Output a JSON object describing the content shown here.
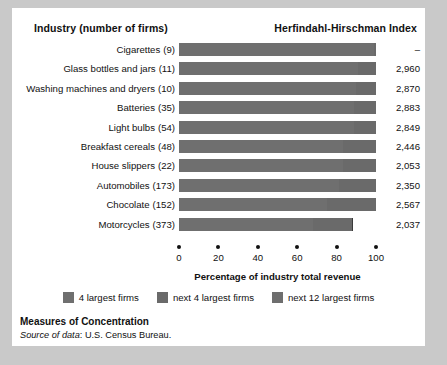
{
  "header": {
    "industry_col": "Industry (number of firms)",
    "hhi_col": "Herfindahl-Hirschman Index"
  },
  "caption": {
    "title": "Measures of Concentration",
    "source_label": "Source of data",
    "source_value": "U.S. Census Bureau."
  },
  "axis": {
    "title": "Percentage of industry total revenue",
    "ticks": [
      "0",
      "20",
      "40",
      "60",
      "80",
      "100"
    ]
  },
  "legend": [
    {
      "label": "4 largest firms",
      "color": "#6f6f6f"
    },
    {
      "label": "next 4 largest firms",
      "color": "#6a6a6a"
    },
    {
      "label": "next 12 largest firms",
      "color": "#6e6e6e"
    }
  ],
  "chart_data": {
    "type": "bar",
    "title": "Measures of Concentration",
    "xlabel": "Percentage of industry total revenue",
    "ylabel": "Industry (number of firms)",
    "xlim": [
      0,
      100
    ],
    "grid": false,
    "legend_position": "bottom",
    "orientation": "horizontal",
    "stacked": true,
    "categories": [
      "Cigarettes",
      "Glass bottles and jars",
      "Washing machines and dryers",
      "Batteries",
      "Light bulbs",
      "Breakfast cereals",
      "House slippers",
      "Automobiles",
      "Chocolate",
      "Motorcycles"
    ],
    "firms": [
      9,
      11,
      10,
      35,
      54,
      48,
      22,
      173,
      152,
      373
    ],
    "hhi": [
      "–",
      "2,960",
      "2,870",
      "2,883",
      "2,849",
      "2,446",
      "2,053",
      "2,350",
      "2,567",
      "2,037"
    ],
    "series": [
      {
        "name": "4 largest firms",
        "values": [
          99,
          91,
          90,
          89,
          89,
          83,
          83,
          81,
          75,
          68
        ]
      },
      {
        "name": "next 4 largest firms",
        "values": [
          1,
          9,
          10,
          11,
          11,
          17,
          17,
          19,
          25,
          20
        ]
      },
      {
        "name": "next 12 largest firms",
        "values": [
          0,
          0,
          0,
          0,
          0,
          0,
          0,
          0,
          0,
          0
        ]
      }
    ],
    "rows": [
      {
        "label": "Cigarettes",
        "firms": "(9)",
        "hhi": "–",
        "s1": 99,
        "s2": 1,
        "s3": 0
      },
      {
        "label": "Glass bottles and jars",
        "firms": "(11)",
        "hhi": "2,960",
        "s1": 91,
        "s2": 9,
        "s3": 0
      },
      {
        "label": "Washing machines and dryers",
        "firms": "(10)",
        "hhi": "2,870",
        "s1": 90,
        "s2": 10,
        "s3": 0
      },
      {
        "label": "Batteries",
        "firms": "(35)",
        "hhi": "2,883",
        "s1": 89,
        "s2": 11,
        "s3": 0
      },
      {
        "label": "Light bulbs",
        "firms": "(54)",
        "hhi": "2,849",
        "s1": 89,
        "s2": 11,
        "s3": 0
      },
      {
        "label": "Breakfast cereals",
        "firms": "(48)",
        "hhi": "2,446",
        "s1": 83,
        "s2": 17,
        "s3": 0
      },
      {
        "label": "House slippers",
        "firms": "(22)",
        "hhi": "2,053",
        "s1": 83,
        "s2": 17,
        "s3": 0
      },
      {
        "label": "Automobiles",
        "firms": "(173)",
        "hhi": "2,350",
        "s1": 81,
        "s2": 19,
        "s3": 0
      },
      {
        "label": "Chocolate",
        "firms": "(152)",
        "hhi": "2,567",
        "s1": 75,
        "s2": 25,
        "s3": 0
      },
      {
        "label": "Motorcycles",
        "firms": "(373)",
        "hhi": "2,037",
        "s1": 68,
        "s2": 20,
        "s3": 0
      }
    ]
  }
}
